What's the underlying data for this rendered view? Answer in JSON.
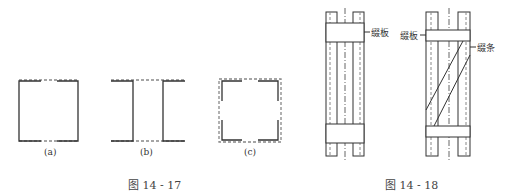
{
  "figure_14_17": {
    "caption": "图 14 - 17",
    "subfigures": [
      {
        "id": "a",
        "label": "(a)"
      },
      {
        "id": "b",
        "label": "(b)"
      },
      {
        "id": "c",
        "label": "(c)"
      }
    ]
  },
  "figure_14_18": {
    "caption": "图 14 - 18",
    "left_figure": {
      "labels": [
        "缀板"
      ]
    },
    "right_figure": {
      "labels": [
        "缀板",
        "缀条"
      ]
    }
  },
  "colors": {
    "line": "#333333",
    "dashed": "#888888",
    "background": "#ffffff"
  }
}
